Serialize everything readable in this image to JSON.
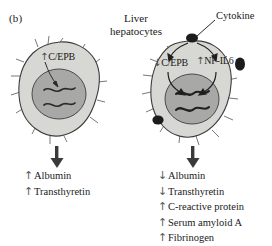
{
  "figure": {
    "panel_label": "(b)",
    "title_line1": "Liver",
    "title_line2": "hepatocytes",
    "cytokine_label": "Cytokine",
    "colors": {
      "cytoplasm": "#d7d7d3",
      "nucleus": "#a8a8a6",
      "outline": "#3c3c3c",
      "cytokine_dot": "#1c1c1c",
      "text": "#1a1a1a",
      "background": "#ffffff"
    }
  },
  "cells": {
    "resting": {
      "name": "resting-hepatocyte",
      "factors": [
        {
          "name": "c-ebp",
          "arrow": "↑",
          "label": "C/EPB"
        }
      ],
      "outputs": [
        {
          "arrow": "↑",
          "label": "Albumin"
        },
        {
          "arrow": "↑",
          "label": "Transthyretin"
        }
      ]
    },
    "stimulated": {
      "name": "cytokine-stimulated-hepatocyte",
      "factors": [
        {
          "name": "c-ebp",
          "arrow": "↓",
          "label": "C/EPB"
        },
        {
          "name": "nf-il6",
          "arrow": "↑",
          "label": "NF-IL6"
        }
      ],
      "outputs": [
        {
          "arrow": "↓",
          "label": "Albumin"
        },
        {
          "arrow": "↓",
          "label": "Transthyretin"
        },
        {
          "arrow": "↑",
          "label": "C-reactive protein"
        },
        {
          "arrow": "↑",
          "label": "Serum amyloid A"
        },
        {
          "arrow": "↑",
          "label": "Fibrinogen"
        }
      ]
    }
  }
}
